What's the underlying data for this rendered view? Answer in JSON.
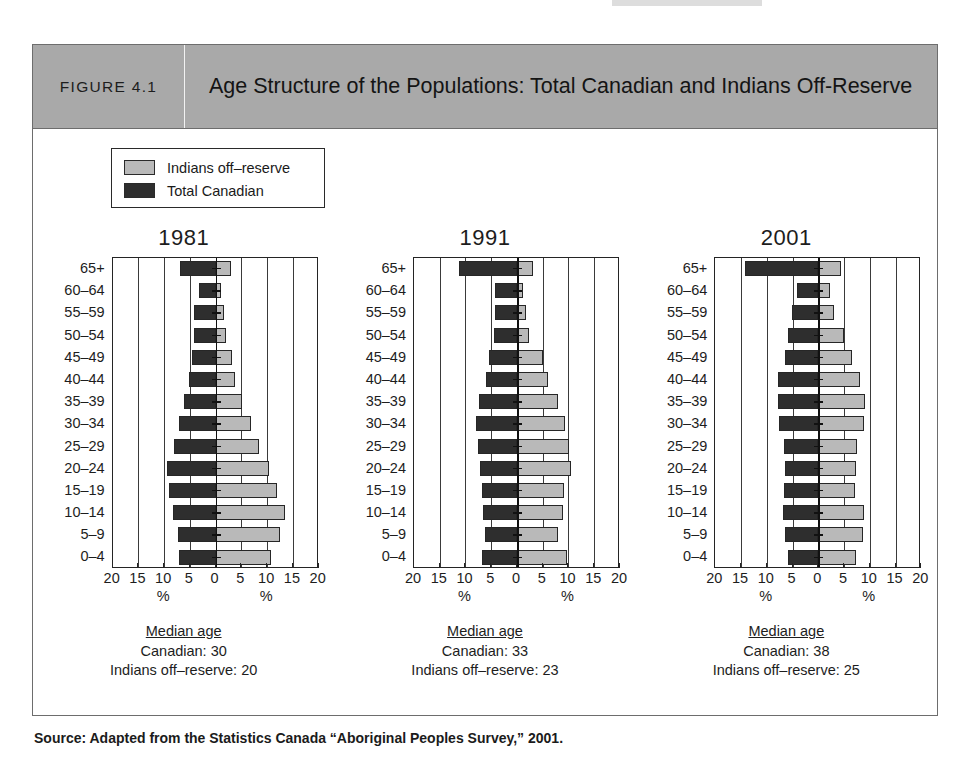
{
  "figure": {
    "number_label": "FIGURE 4.1",
    "title": "Age Structure of the Populations: Total Canadian and Indians Off-Reserve",
    "source": "Source: Adapted from the Statistics Canada “Aboriginal Peoples Survey,” 2001."
  },
  "legend": {
    "items": [
      {
        "label": "Indians off–reserve",
        "swatch": "light",
        "color": "#b9b9b9"
      },
      {
        "label": "Total Canadian",
        "swatch": "dark",
        "color": "#2e2e2e"
      }
    ]
  },
  "axis": {
    "ticks": [
      "20",
      "15",
      "10",
      "5",
      "0",
      "5",
      "10",
      "15",
      "20"
    ],
    "unit_label": "%",
    "max": 20,
    "grid_step": 5
  },
  "panels": [
    {
      "id": "panel-1981",
      "title": "1981",
      "median": {
        "heading": "Median age",
        "canadian": "Canadian: 30",
        "indians": "Indians off–reserve: 20"
      }
    },
    {
      "id": "panel-1991",
      "title": "1991",
      "median": {
        "heading": "Median age",
        "canadian": "Canadian: 33",
        "indians": "Indians off–reserve: 23"
      }
    },
    {
      "id": "panel-2001",
      "title": "2001",
      "median": {
        "heading": "Median age",
        "canadian": "Canadian: 38",
        "indians": "Indians off–reserve: 25"
      }
    }
  ],
  "chart_data": [
    {
      "type": "bar",
      "subtype": "population-pyramid",
      "title": "1981",
      "xlabel": "%",
      "ylabel": "",
      "xlim": [
        -20,
        20
      ],
      "grid": true,
      "legend_position": "top-left",
      "categories": [
        "65+",
        "60–64",
        "55–59",
        "50–54",
        "45–49",
        "40–44",
        "35–39",
        "30–34",
        "25–29",
        "20–24",
        "15–19",
        "10–14",
        "5–9",
        "0–4"
      ],
      "series": [
        {
          "name": "Total Canadian",
          "side": "left",
          "color": "#2e2e2e",
          "values": [
            7.0,
            3.2,
            4.2,
            4.3,
            4.5,
            5.2,
            6.2,
            7.1,
            8.1,
            9.5,
            9.0,
            8.2,
            7.4,
            7.1
          ]
        },
        {
          "name": "Indians off–reserve",
          "side": "right",
          "color": "#b9b9b9",
          "values": [
            3.0,
            1.0,
            1.6,
            2.0,
            3.1,
            3.8,
            5.2,
            6.9,
            8.4,
            10.3,
            12.0,
            13.4,
            12.4,
            10.8
          ]
        }
      ]
    },
    {
      "type": "bar",
      "subtype": "population-pyramid",
      "title": "1991",
      "xlabel": "%",
      "ylabel": "",
      "xlim": [
        -20,
        20
      ],
      "grid": true,
      "legend_position": "top-left",
      "categories": [
        "65+",
        "60–64",
        "55–59",
        "50–54",
        "45–49",
        "40–44",
        "35–39",
        "30–34",
        "25–29",
        "20–24",
        "15–19",
        "10–14",
        "5–9",
        "0–4"
      ],
      "series": [
        {
          "name": "Total Canadian",
          "side": "left",
          "color": "#2e2e2e",
          "values": [
            11.3,
            4.3,
            4.3,
            4.4,
            5.5,
            6.0,
            7.3,
            7.9,
            7.6,
            7.2,
            6.7,
            6.6,
            6.2,
            6.7
          ]
        },
        {
          "name": "Indians off–reserve",
          "side": "right",
          "color": "#b9b9b9",
          "values": [
            3.2,
            1.1,
            1.8,
            2.3,
            5.0,
            6.0,
            8.0,
            9.4,
            10.1,
            10.5,
            9.2,
            8.9,
            8.0,
            9.7
          ]
        }
      ]
    },
    {
      "type": "bar",
      "subtype": "population-pyramid",
      "title": "2001",
      "xlabel": "%",
      "ylabel": "",
      "xlim": [
        -20,
        20
      ],
      "grid": true,
      "legend_position": "top-left",
      "categories": [
        "65+",
        "60–64",
        "55–59",
        "50–54",
        "45–49",
        "40–44",
        "35–39",
        "30–34",
        "25–29",
        "20–24",
        "15–19",
        "10–14",
        "5–9",
        "0–4"
      ],
      "series": [
        {
          "name": "Total Canadian",
          "side": "left",
          "color": "#2e2e2e",
          "values": [
            14.3,
            4.2,
            5.2,
            5.9,
            6.5,
            7.8,
            7.9,
            7.7,
            6.6,
            6.4,
            6.6,
            6.8,
            6.4,
            5.8
          ]
        },
        {
          "name": "Indians off–reserve",
          "side": "right",
          "color": "#b9b9b9",
          "values": [
            4.4,
            2.2,
            3.0,
            4.9,
            6.6,
            8.0,
            9.0,
            8.8,
            7.6,
            7.4,
            7.2,
            8.8,
            8.7,
            7.4
          ]
        }
      ]
    }
  ]
}
